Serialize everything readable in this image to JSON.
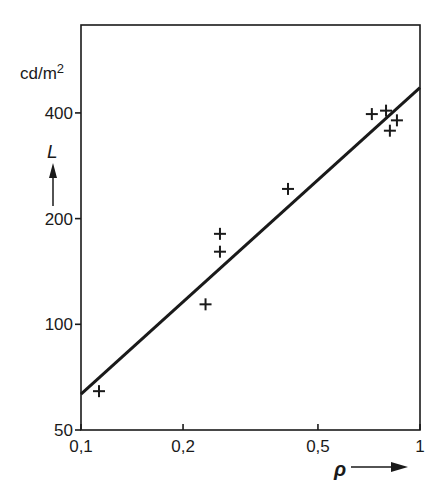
{
  "chart_data": {
    "type": "scatter",
    "title": "",
    "xlabel": "ρ",
    "ylabel": "L",
    "yunit": "cd/m²",
    "xscale": "log",
    "yscale": "log",
    "xlim": [
      0.1,
      1
    ],
    "ylim": [
      50,
      712
    ],
    "xticks": [
      0.1,
      0.2,
      0.5,
      1
    ],
    "xtick_labels": [
      "0,1",
      "0,2",
      "0,5",
      "1"
    ],
    "yticks": [
      50,
      100,
      200,
      400
    ],
    "ytick_labels": [
      "50",
      "100",
      "200",
      "400"
    ],
    "grid": false,
    "legend": null,
    "series": [
      {
        "name": "measurements",
        "marker": "+",
        "points": [
          {
            "x": 0.113,
            "y": 64.5
          },
          {
            "x": 0.233,
            "y": 114
          },
          {
            "x": 0.257,
            "y": 161
          },
          {
            "x": 0.257,
            "y": 181
          },
          {
            "x": 0.408,
            "y": 243
          },
          {
            "x": 0.721,
            "y": 397
          },
          {
            "x": 0.794,
            "y": 406
          },
          {
            "x": 0.855,
            "y": 381
          },
          {
            "x": 0.815,
            "y": 356
          }
        ]
      },
      {
        "name": "fit",
        "type": "line",
        "points": [
          {
            "x": 0.1,
            "y": 63.3
          },
          {
            "x": 1,
            "y": 472
          }
        ]
      }
    ]
  },
  "labels": {
    "y_unit_text": "cd/m",
    "y_unit_sup": "2",
    "y_symbol": "L",
    "x_symbol": "ρ"
  },
  "colors": {
    "ink": "#1a1a1a",
    "background": "#ffffff"
  }
}
